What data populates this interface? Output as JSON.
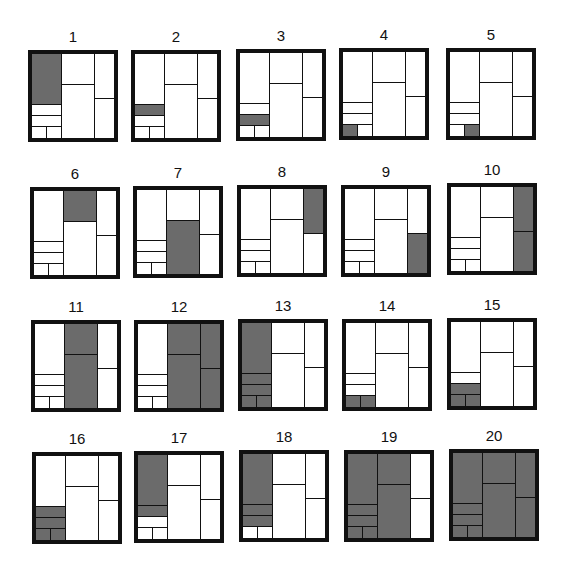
{
  "figure": {
    "shade_color": "#6b6b6b",
    "line_color": "#111111",
    "background": "#ffffff",
    "cell_keys": {
      "L1": "left column tall top",
      "L2": "left column row 2",
      "L3": "left column row 3",
      "L4a": "left column bottom-left",
      "L4b": "left column bottom-right",
      "M1": "middle column top",
      "M2": "middle column bottom",
      "R1": "right column top",
      "R2": "right column bottom"
    },
    "panels": [
      {
        "label": "1",
        "x": 28,
        "y": 50,
        "shaded": [
          "L1"
        ]
      },
      {
        "label": "2",
        "x": 131,
        "y": 50,
        "shaded": [
          "L2"
        ]
      },
      {
        "label": "3",
        "x": 236,
        "y": 49,
        "shaded": [
          "L3"
        ]
      },
      {
        "label": "4",
        "x": 339,
        "y": 48,
        "shaded": [
          "L4a"
        ]
      },
      {
        "label": "5",
        "x": 446,
        "y": 48,
        "shaded": [
          "L4b"
        ]
      },
      {
        "label": "6",
        "x": 30,
        "y": 187,
        "shaded": [
          "M1"
        ]
      },
      {
        "label": "7",
        "x": 133,
        "y": 186,
        "shaded": [
          "M2"
        ]
      },
      {
        "label": "8",
        "x": 237,
        "y": 185,
        "shaded": [
          "R1"
        ]
      },
      {
        "label": "9",
        "x": 341,
        "y": 185,
        "shaded": [
          "R2"
        ]
      },
      {
        "label": "10",
        "x": 447,
        "y": 183,
        "shaded": [
          "R1",
          "R2"
        ]
      },
      {
        "label": "11",
        "x": 31,
        "y": 320,
        "shaded": [
          "M1",
          "M2"
        ]
      },
      {
        "label": "12",
        "x": 134,
        "y": 320,
        "shaded": [
          "M1",
          "M2",
          "R1",
          "R2"
        ]
      },
      {
        "label": "13",
        "x": 238,
        "y": 319,
        "shaded": [
          "L1",
          "L2",
          "L3",
          "L4a",
          "L4b"
        ]
      },
      {
        "label": "14",
        "x": 342,
        "y": 319,
        "shaded": [
          "L4a",
          "L4b"
        ]
      },
      {
        "label": "15",
        "x": 447,
        "y": 318,
        "shaded": [
          "L3",
          "L4a",
          "L4b"
        ]
      },
      {
        "label": "16",
        "x": 32,
        "y": 452,
        "shaded": [
          "L2",
          "L3",
          "L4a",
          "L4b"
        ]
      },
      {
        "label": "17",
        "x": 134,
        "y": 451,
        "shaded": [
          "L1",
          "L2"
        ]
      },
      {
        "label": "18",
        "x": 239,
        "y": 450,
        "shaded": [
          "L1",
          "L2",
          "L3"
        ]
      },
      {
        "label": "19",
        "x": 344,
        "y": 450,
        "shaded": [
          "L1",
          "L2",
          "L3",
          "L4a",
          "L4b",
          "M1",
          "M2"
        ]
      },
      {
        "label": "20",
        "x": 449,
        "y": 449,
        "shaded": [
          "L1",
          "L2",
          "L3",
          "L4a",
          "L4b",
          "M1",
          "M2",
          "R1",
          "R2"
        ]
      }
    ]
  }
}
